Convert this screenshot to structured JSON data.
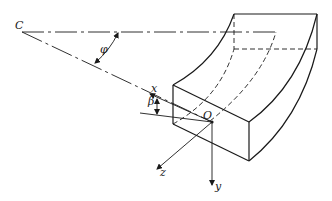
{
  "diagram": {
    "labels": {
      "center": "C",
      "angle_phi": "φ",
      "angle_beta": "β",
      "origin": "O",
      "axis_x": "x",
      "axis_y": "y",
      "axis_z": "z"
    },
    "colors": {
      "line": "#1a1a1a",
      "background": "#ffffff"
    }
  }
}
